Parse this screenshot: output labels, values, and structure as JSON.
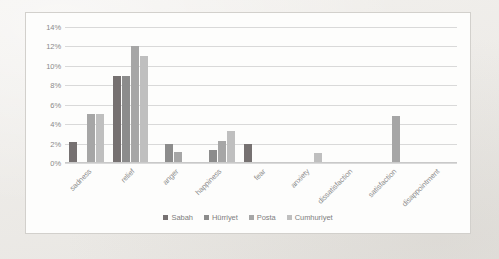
{
  "chart_data": {
    "type": "bar",
    "title": "",
    "subtitle": "",
    "xlabel": "",
    "ylabel": "",
    "ylim": [
      0,
      14
    ],
    "ytick_labels": [
      "14%",
      "12%",
      "10%",
      "8%",
      "6%",
      "4%",
      "2%",
      "0%"
    ],
    "ytick_values": [
      14,
      12,
      10,
      8,
      6,
      4,
      2,
      0
    ],
    "grid": true,
    "legend_position": "bottom",
    "categories": [
      "sadness",
      "relief",
      "anger",
      "happiness",
      "fear",
      "anxiety",
      "dissatisfaction",
      "satisfaction",
      "disappointment"
    ],
    "series": [
      {
        "name": "Sabah",
        "color": "#767171",
        "values": [
          2.2,
          9.0,
          0,
          0,
          2.0,
          0,
          0,
          0,
          0
        ]
      },
      {
        "name": "Hürriyet",
        "color": "#8c8c8c",
        "values": [
          0,
          9.0,
          2.0,
          1.3,
          0,
          0,
          0,
          0,
          0
        ]
      },
      {
        "name": "Posta",
        "color": "#a6a6a6",
        "values": [
          5.0,
          12.0,
          1.1,
          2.3,
          0,
          0,
          0,
          4.8,
          0
        ]
      },
      {
        "name": "Cumhuriyet",
        "color": "#bfbfbf",
        "values": [
          5.0,
          11.0,
          0,
          3.3,
          0,
          1.0,
          0,
          0,
          0
        ]
      }
    ]
  }
}
